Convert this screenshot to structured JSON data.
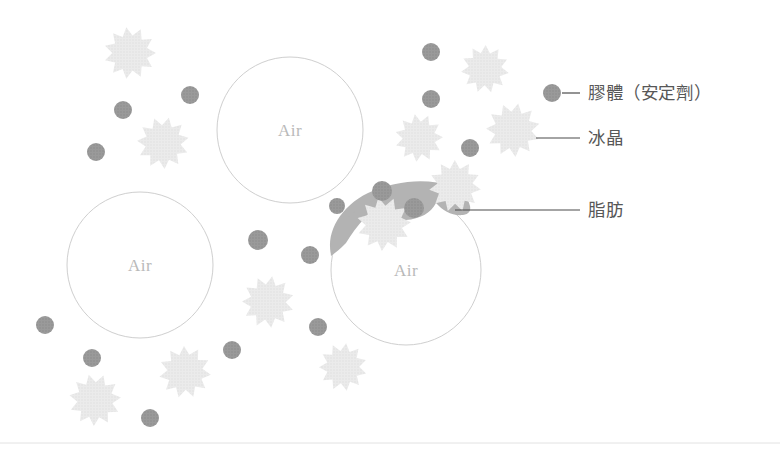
{
  "figure": {
    "width": 780,
    "height": 454,
    "background": "#ffffff"
  },
  "colors": {
    "bubble_stroke": "#cfcfcf",
    "bubble_fill": "#ffffff",
    "crystal": "#e7e7e7",
    "colloid": "#989898",
    "fat": "#b3b3b3",
    "leader_line": "#4a4a4a",
    "legend_text": "#575757",
    "air_label": "#b9b9b9",
    "baseline": "#e2e2e2"
  },
  "air_bubbles": [
    {
      "label": "Air",
      "cx": 290,
      "cy": 130,
      "r": 73
    },
    {
      "label": "Air",
      "cx": 140,
      "cy": 265,
      "r": 73
    },
    {
      "label": "Air",
      "cx": 406,
      "cy": 270,
      "r": 75
    }
  ],
  "ice_crystals": [
    {
      "cx": 130,
      "cy": 53,
      "r": 26
    },
    {
      "cx": 163,
      "cy": 143,
      "r": 26
    },
    {
      "cx": 485,
      "cy": 69,
      "r": 24
    },
    {
      "cx": 419,
      "cy": 138,
      "r": 24
    },
    {
      "cx": 513,
      "cy": 130,
      "r": 27
    },
    {
      "cx": 455,
      "cy": 186,
      "r": 26
    },
    {
      "cx": 384,
      "cy": 224,
      "r": 27
    },
    {
      "cx": 268,
      "cy": 302,
      "r": 26
    },
    {
      "cx": 185,
      "cy": 372,
      "r": 26
    },
    {
      "cx": 95,
      "cy": 400,
      "r": 26
    },
    {
      "cx": 343,
      "cy": 367,
      "r": 24
    }
  ],
  "colloid_particles": [
    {
      "cx": 190,
      "cy": 95,
      "r": 9
    },
    {
      "cx": 123,
      "cy": 110,
      "r": 9
    },
    {
      "cx": 96,
      "cy": 152,
      "r": 9
    },
    {
      "cx": 431,
      "cy": 52,
      "r": 9
    },
    {
      "cx": 431,
      "cy": 99,
      "r": 9
    },
    {
      "cx": 470,
      "cy": 148,
      "r": 9
    },
    {
      "cx": 382,
      "cy": 191,
      "r": 10
    },
    {
      "cx": 414,
      "cy": 208,
      "r": 10
    },
    {
      "cx": 337,
      "cy": 206,
      "r": 8
    },
    {
      "cx": 258,
      "cy": 240,
      "r": 10
    },
    {
      "cx": 310,
      "cy": 255,
      "r": 9
    },
    {
      "cx": 45,
      "cy": 325,
      "r": 9
    },
    {
      "cx": 92,
      "cy": 358,
      "r": 9
    },
    {
      "cx": 232,
      "cy": 350,
      "r": 9
    },
    {
      "cx": 318,
      "cy": 327,
      "r": 9
    },
    {
      "cx": 150,
      "cy": 418,
      "r": 9
    }
  ],
  "legend": {
    "items": [
      {
        "id": "colloid",
        "label": "膠體（安定劑）",
        "marker": "dot",
        "text_x": 588,
        "text_y": 99,
        "line_x1": 562,
        "line_x2": 580,
        "line_y": 93,
        "dot_cx": 552,
        "dot_cy": 93,
        "dot_r": 9
      },
      {
        "id": "ice-crystal",
        "label": "冰晶",
        "marker": "star",
        "text_x": 588,
        "text_y": 144,
        "line_x1": 536,
        "line_x2": 580,
        "line_y": 138
      },
      {
        "id": "fat",
        "label": "脂肪",
        "marker": "blob",
        "text_x": 588,
        "text_y": 216,
        "line_x1": 455,
        "line_x2": 580,
        "line_y": 210
      }
    ]
  },
  "baseline": {
    "x1": 0,
    "x2": 780,
    "y": 443
  }
}
